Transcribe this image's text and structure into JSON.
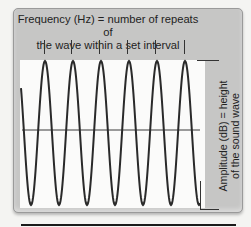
{
  "diagram": {
    "type": "sound-wave-explainer",
    "frequency_label": {
      "line1": "Frequency (Hz) = number of repeats of",
      "line2": "the wave within a set interval"
    },
    "amplitude_label": {
      "line1": "Amplitude (dB) = height",
      "line2": "of the sound wave"
    },
    "wave": {
      "cycles_shown": 6,
      "peak_x": [
        45,
        73,
        101,
        129,
        157,
        185
      ],
      "tick_x": [
        44,
        71,
        99,
        127,
        155,
        184
      ],
      "stroke_color": "#2a2a2a",
      "midline_color": "#3a3a3a"
    },
    "colors": {
      "panel": "#c6c6c5",
      "plot_background": "#fbfbfa",
      "page_background": "#f4f4f2"
    }
  }
}
